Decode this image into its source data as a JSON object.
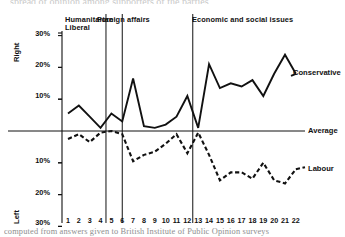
{
  "figure": {
    "top_cut_text": "spread of opinion among  supporters of the  parties",
    "caption": "computed from  answers  given  to  British  Institute  of  Public  Opinion  surveys"
  },
  "axes": {
    "y_top_label": "Right",
    "y_bottom_label": "Left",
    "y_ticks_upper": [
      "30%",
      "20%",
      "10%"
    ],
    "y_ticks_lower": [
      "10%",
      "20%",
      "30%"
    ],
    "baseline_label": "Average",
    "x_ticks": [
      "1",
      "2",
      "3",
      "4",
      "5",
      "6",
      "7",
      "8",
      "9",
      "10",
      "11",
      "12",
      "13",
      "14",
      "15",
      "16",
      "17",
      "18",
      "19",
      "20",
      "21",
      "22"
    ]
  },
  "segments": [
    {
      "id": "humanitarian-liberal",
      "line1": "Humanitarian",
      "line2": "Liberal"
    },
    {
      "id": "foreign-affairs",
      "line1": "Foreign affairs",
      "line2": ""
    },
    {
      "id": "economic-and-social-issues",
      "line1": "Economic and social issues",
      "line2": ""
    }
  ],
  "series_labels": {
    "conservative": "Conservative",
    "labour": "Labour"
  },
  "colors": {
    "ink": "#111111",
    "background": "#ffffff",
    "caption": "#8e8e8e"
  },
  "chart_data": {
    "type": "line",
    "title": "",
    "xlabel": "",
    "ylabel": "Deviation from average (Right / Left)",
    "ylim": [
      -30,
      35
    ],
    "grid": false,
    "legend": "inline-end-of-line",
    "x": [
      1,
      2,
      3,
      4,
      5,
      6,
      7,
      8,
      9,
      10,
      11,
      12,
      13,
      14,
      15,
      16,
      17,
      18,
      19,
      20,
      21,
      22
    ],
    "series": [
      {
        "name": "Conservative",
        "style": "solid",
        "values": [
          5.5,
          8.0,
          4.5,
          1.0,
          5.5,
          3.0,
          16.5,
          1.5,
          1.0,
          2.0,
          4.5,
          11.0,
          1.0,
          21.0,
          13.5,
          15.0,
          14.0,
          16.0,
          11.0,
          18.0,
          24.0,
          18.0
        ]
      },
      {
        "name": "Labour",
        "style": "dashed",
        "values": [
          -2.5,
          -1.0,
          -3.5,
          -0.5,
          0.0,
          -1.0,
          -9.5,
          -7.5,
          -6.5,
          -4.0,
          -1.0,
          -7.0,
          -0.5,
          -7.5,
          -15.5,
          -13.0,
          -13.0,
          -15.0,
          -10.0,
          -15.5,
          -16.5,
          -12.0
        ]
      },
      {
        "name": "Average",
        "style": "baseline",
        "values": [
          0,
          0,
          0,
          0,
          0,
          0,
          0,
          0,
          0,
          0,
          0,
          0,
          0,
          0,
          0,
          0,
          0,
          0,
          0,
          0,
          0,
          0
        ]
      }
    ],
    "dividers": [
      {
        "after_x": 4.5,
        "label": "Humanitarian Liberal"
      },
      {
        "after_x": 6.0,
        "label": "Foreign affairs"
      },
      {
        "after_x": 12.5,
        "label": "Economic and social issues"
      }
    ]
  }
}
